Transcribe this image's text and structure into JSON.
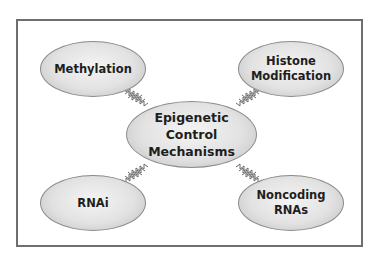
{
  "diagram": {
    "center": {
      "line1": "Epigenetic Control",
      "line2": "Mechanisms"
    },
    "nodes": [
      {
        "id": "methylation",
        "line1": "Methylation",
        "line2": ""
      },
      {
        "id": "histone-modification",
        "line1": "Histone",
        "line2": "Modification"
      },
      {
        "id": "rnai",
        "line1": "RNAi",
        "line2": ""
      },
      {
        "id": "noncoding-rnas",
        "line1": "Noncoding",
        "line2": "RNAs"
      }
    ],
    "connector_style": "zigzag",
    "colors": {
      "frame": "#6e6e6e",
      "node_fill": "#e2e2e2",
      "node_border": "#8a8a8a",
      "text": "#1e1e1e",
      "connector": "#6a6a6a"
    }
  }
}
